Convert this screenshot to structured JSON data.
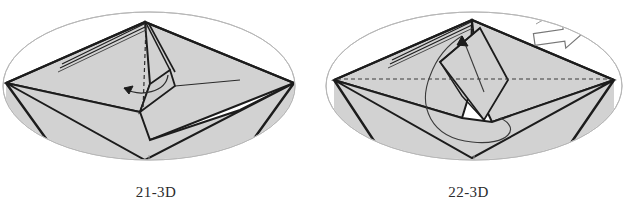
{
  "page": {
    "background_color": "#ffffff",
    "width": 625,
    "height": 211
  },
  "style": {
    "paper_fill": "#d2d2d2",
    "paper_fill_shadow": "#c4c4c4",
    "paper_fill_light": "#dcdcdc",
    "edge_color": "#1c1c1c",
    "ellipse_color": "#b0b0b0",
    "dashed_color": "#3a3a3a",
    "arrow_outline_color": "#555555",
    "caption_color": "#2b2b2b",
    "white": "#ffffff"
  },
  "figures": [
    {
      "id": "figure-21",
      "caption": "21-3D",
      "description": "Origami model step 21, three-dimensional view inside an oval frame",
      "frame": {
        "shape": "ellipse",
        "cx": 149,
        "cy": 86,
        "rx": 146,
        "ry": 74
      },
      "annotations": [
        {
          "name": "valley-fold-dashed-line",
          "type": "dashed-line",
          "orientation": "vertical"
        },
        {
          "name": "curved-fold-arrow",
          "type": "curved-arrow",
          "direction": "counter-clockwise-up-left"
        },
        {
          "name": "center-tick-mark",
          "type": "tick"
        }
      ]
    },
    {
      "id": "figure-22",
      "caption": "22-3D",
      "description": "Origami model step 22, three-dimensional view inside an oval frame",
      "frame": {
        "shape": "ellipse",
        "cx": 162,
        "cy": 86,
        "rx": 148,
        "ry": 74
      },
      "annotations": [
        {
          "name": "horizontal-dashed-crease",
          "type": "dashed-line",
          "orientation": "horizontal"
        },
        {
          "name": "loop-fold-arrow",
          "type": "curved-arrow",
          "direction": "loop-up"
        },
        {
          "name": "turn-over-arrow",
          "type": "hollow-arrow",
          "direction": "right"
        },
        {
          "name": "center-tick-mark",
          "type": "tick"
        }
      ]
    }
  ]
}
